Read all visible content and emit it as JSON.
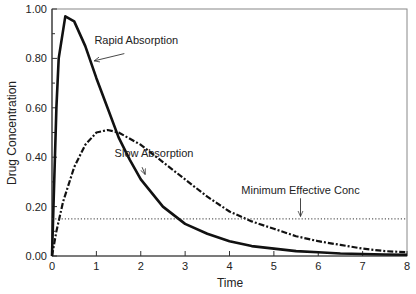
{
  "chart_data": {
    "type": "line",
    "title": "",
    "xlabel": "Time",
    "ylabel": "Drug Concentration",
    "xlim": [
      0,
      8
    ],
    "ylim": [
      0,
      1.0
    ],
    "xticks": [
      "0",
      "1",
      "2",
      "3",
      "4",
      "5",
      "6",
      "7",
      "8"
    ],
    "yticks": [
      "0.00",
      "0.20",
      "0.40",
      "0.60",
      "0.80",
      "1.00"
    ],
    "grid": false,
    "series": [
      {
        "name": "Rapid Absorption",
        "style": "solid",
        "x": [
          0,
          0.1,
          0.15,
          0.3,
          0.5,
          0.75,
          1.0,
          1.25,
          1.5,
          1.75,
          2.0,
          2.5,
          3.0,
          3.5,
          4.0,
          4.5,
          5.0,
          5.5,
          6.0,
          6.5,
          7.0,
          7.5,
          8.0
        ],
        "y": [
          0,
          0.6,
          0.8,
          0.97,
          0.95,
          0.85,
          0.72,
          0.6,
          0.48,
          0.39,
          0.31,
          0.2,
          0.13,
          0.09,
          0.06,
          0.04,
          0.03,
          0.02,
          0.015,
          0.01,
          0.008,
          0.006,
          0.005
        ]
      },
      {
        "name": "Slow Absorption",
        "style": "dashdot",
        "x": [
          0,
          0.1,
          0.25,
          0.5,
          0.75,
          1.0,
          1.25,
          1.5,
          2.0,
          2.5,
          3.0,
          3.5,
          4.0,
          4.5,
          5.0,
          5.5,
          6.0,
          6.5,
          7.0,
          7.5,
          8.0
        ],
        "y": [
          0,
          0.1,
          0.22,
          0.36,
          0.45,
          0.5,
          0.51,
          0.5,
          0.45,
          0.38,
          0.31,
          0.24,
          0.18,
          0.14,
          0.11,
          0.08,
          0.06,
          0.045,
          0.03,
          0.02,
          0.015
        ]
      },
      {
        "name": "Minimum Effective Conc",
        "style": "dotted",
        "x": [
          0,
          8
        ],
        "y": [
          0.15,
          0.15
        ]
      }
    ],
    "annotations": [
      {
        "text": "Rapid Absorption",
        "text_x": 1.9,
        "text_y": 0.86,
        "arrow_to": [
          0.95,
          0.79
        ]
      },
      {
        "text": "Slow Absorption",
        "text_x": 2.3,
        "text_y": 0.4,
        "arrow_to": [
          2.1,
          0.33
        ]
      },
      {
        "text": "Minimum Effective Conc",
        "text_x": 5.6,
        "text_y": 0.25,
        "arrow_to": [
          5.6,
          0.16
        ]
      }
    ]
  },
  "colors": {
    "axis": "#333333",
    "line": "#111111"
  }
}
